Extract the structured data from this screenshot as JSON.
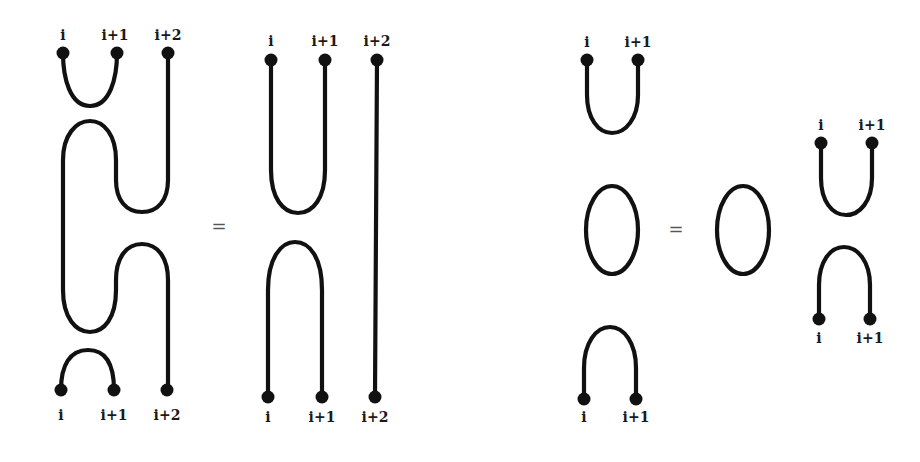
{
  "diagram": {
    "type": "Temperley-Lieb diagram relations",
    "stroke_color": "#111111",
    "background": "#ffffff",
    "relations": [
      {
        "name": "isotopy-relation",
        "equals_sign": "=",
        "lhs": {
          "top_labels": [
            "i",
            "i+1",
            "i+2"
          ],
          "bottom_labels": [
            "i",
            "i+1",
            "i+2"
          ],
          "description": "cup(i,i+1) on top, snake strand, cap(i,i+1) at bottom"
        },
        "rhs": {
          "top_labels": [
            "i",
            "i+1",
            "i+2"
          ],
          "bottom_labels": [
            "i",
            "i+1",
            "i+2"
          ],
          "description": "cup(i,i+1) over cap(i,i+1), straight strand at i+2"
        }
      },
      {
        "name": "loop-removal-relation",
        "equals_sign": "=",
        "lhs": {
          "top_labels": [
            "i",
            "i+1"
          ],
          "bottom_labels": [
            "i",
            "i+1"
          ],
          "description": "cup, closed loop, cap stacked vertically"
        },
        "rhs": {
          "loop": "closed loop",
          "top_labels": [
            "i",
            "i+1"
          ],
          "bottom_labels": [
            "i",
            "i+1"
          ],
          "description": "closed loop beside cup over cap"
        }
      }
    ]
  }
}
